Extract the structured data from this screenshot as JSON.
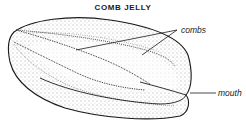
{
  "diagram": {
    "title": "COMB JELLY",
    "labels": {
      "combs": "combs",
      "mouth": "mouth"
    },
    "colors": {
      "ink": "#1a1a1a",
      "background": "#ffffff"
    }
  }
}
